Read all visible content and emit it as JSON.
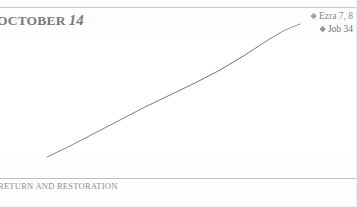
{
  "page": {
    "date_heading": {
      "month": "OCTOBER",
      "day": "14"
    },
    "footer_title": "RETURN AND RESTORATION"
  },
  "readings": {
    "bullet_icon": "❖",
    "items": [
      {
        "label": "Ezra 7, 8"
      },
      {
        "label": "Job 34"
      }
    ]
  },
  "chart_data": {
    "type": "line",
    "title": "",
    "subtitle": "",
    "xlabel": "",
    "ylabel": "",
    "grid": false,
    "legend_position": "top-right",
    "axis_visible": false,
    "xlim": [
      0,
      357
    ],
    "ylim": [
      0,
      207
    ],
    "series": [
      {
        "name": "reading progress",
        "color": "#6b6b70",
        "linewidth": 1,
        "x": [
          47,
          70,
          95,
          120,
          145,
          170,
          195,
          220,
          245,
          268,
          285,
          300
        ],
        "y": [
          157,
          146,
          133,
          120,
          107,
          95,
          83,
          70,
          55,
          40,
          30,
          24
        ]
      }
    ],
    "annotations": []
  },
  "colors": {
    "rule": "#8e8e93",
    "text": "#3b3b3f",
    "curve": "#6b6b70",
    "background": "#ffffff"
  }
}
